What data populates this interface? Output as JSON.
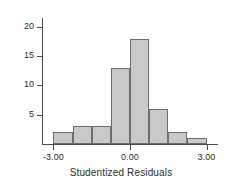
{
  "chart_data": {
    "type": "bar",
    "title": "",
    "subtitle": "",
    "xlabel": "Studentized Residuals",
    "ylabel": "",
    "categories": [
      "-3.00 to -2.25",
      "-2.25 to -1.50",
      "-1.50 to -0.75",
      "-0.75 to 0.00",
      "0.00 to 0.75",
      "0.75 to 1.50",
      "1.50 to 2.25",
      "2.25 to 3.00"
    ],
    "bin_centers": [
      -2.625,
      -1.875,
      -1.125,
      -0.375,
      0.375,
      1.125,
      1.875,
      2.625
    ],
    "bin_edges": [
      -3.0,
      -2.25,
      -1.5,
      -0.75,
      0.0,
      0.75,
      1.5,
      2.25,
      3.0
    ],
    "values": [
      2,
      3,
      3,
      13,
      18,
      6,
      2,
      1
    ],
    "xlim": [
      -3.45,
      3.45
    ],
    "ylim": [
      0,
      21.5
    ],
    "x_ticks": [
      -3.0,
      0.0,
      3.0
    ],
    "x_tick_labels": [
      "-3.00",
      "0.00",
      "3.00"
    ],
    "y_ticks": [
      5,
      10,
      15,
      20
    ],
    "y_tick_labels": [
      "5",
      "10",
      "15",
      "20"
    ],
    "grid": false,
    "legend": false,
    "legend_position": "none",
    "bar_fill_color": "#c9c9c9",
    "bar_edge_color": "#6e6e6e",
    "axis_color": "#4d4d4d",
    "text_color": "#2b2b2b",
    "background_color": "#ffffff"
  }
}
